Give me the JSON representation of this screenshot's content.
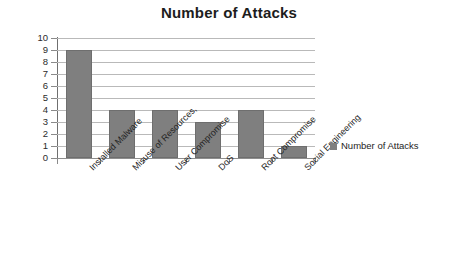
{
  "chart_data": {
    "type": "bar",
    "title": "Number of Attacks",
    "xlabel": "",
    "ylabel": "",
    "ylim": [
      0,
      10
    ],
    "ytick_step": 1,
    "yticks": [
      10,
      9,
      8,
      7,
      6,
      5,
      4,
      3,
      2,
      1,
      0
    ],
    "grid": true,
    "legend_position": "right",
    "categories": [
      "Installed Malware",
      "Misuse of Resources,",
      "User Compromise",
      "DoS",
      "Root Compromise",
      "Social Engineering"
    ],
    "series": [
      {
        "name": "Number of Attacks",
        "values": [
          9,
          4,
          4,
          3,
          4,
          1
        ],
        "color": "#7f7f7f"
      }
    ]
  },
  "legend": {
    "entries": [
      {
        "label": "Number of Attacks",
        "color": "#7f7f7f"
      }
    ]
  },
  "colors": {
    "bar": "#7f7f7f",
    "gridline": "#b9b9b9",
    "axis": "#6f6f6f",
    "background": "#ffffff",
    "text": "#1d1d1d"
  }
}
